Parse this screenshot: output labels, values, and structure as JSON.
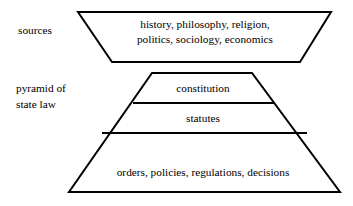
{
  "diagram": {
    "background_color": "#ffffff",
    "line_color": "#000000",
    "text_color": "#000000",
    "labels": {
      "sources": "sources",
      "pyramid_line1": "pyramid of",
      "pyramid_line2": "state law"
    },
    "sources_block": {
      "name": "sources",
      "shape": "inverted-trapezoid",
      "text_lines": [
        "history, philosophy, religion,",
        "politics, sociology, economics"
      ]
    },
    "pyramid": {
      "name": "pyramid of state law",
      "shape": "trapezoid-pyramid",
      "tiers": [
        {
          "level": 1,
          "label": "constitution"
        },
        {
          "level": 2,
          "label": "statutes"
        },
        {
          "level": 3,
          "label": "orders, policies, regulations, decisions"
        }
      ]
    }
  }
}
